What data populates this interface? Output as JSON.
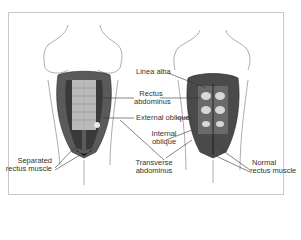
{
  "figure": {
    "title": "",
    "left_torso": {
      "caption": "Diastasis recti (separated)"
    },
    "right_torso": {
      "caption": "Normal abdomen"
    },
    "labels": {
      "linea_alba": "Linea alba",
      "rectus_abdominus_1": "Rectus",
      "rectus_abdominus_2": "abdominus",
      "external_oblique": "External oblique",
      "internal_oblique_1": "Internal",
      "internal_oblique_2": "oblique",
      "transverse_abdominus_1": "Transverse",
      "transverse_abdominus_2": "abdominus",
      "separated_rectus_1": "Separated",
      "separated_rectus_2": "rectus muscle",
      "normal_rectus_1": "Normal",
      "normal_rectus_2": "rectus muscle"
    },
    "colors": {
      "outline": "#8a8a8a",
      "muscle_dark": "#2a2a2a",
      "muscle_mid": "#6a6a6a",
      "muscle_light": "#d8d8d8",
      "leader_line": "#333333",
      "frame": "#c8c8c8"
    }
  }
}
